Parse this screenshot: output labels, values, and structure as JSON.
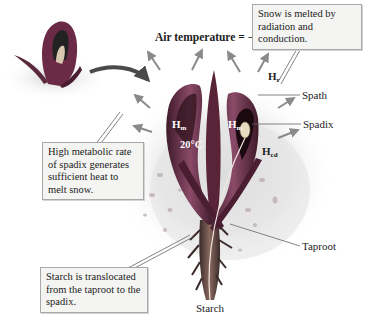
{
  "title": "Air temperature = − 15°C",
  "callouts": {
    "snow_melt": "Snow is melted by radiation and conduction.",
    "metabolic": "High metabolic rate of spadix generates sufficient heat to melt snow.",
    "starch": "Starch is translocated from the taproot to the spadix."
  },
  "labels": {
    "spath": "Spath",
    "spadix": "Spadix",
    "taproot": "Taproot",
    "starch": "Starch",
    "inner_temp": "20°C"
  },
  "heat_symbols": {
    "h_r": {
      "base": "H",
      "sub": "r"
    },
    "h_m_left": {
      "base": "H",
      "sub": "m"
    },
    "h_m_right": {
      "base": "H",
      "sub": "m"
    },
    "h_cd": {
      "base": "H",
      "sub": "cd"
    }
  },
  "colors": {
    "plant": "#6b2a45",
    "plant_light": "#a86585",
    "arrow": "#8a8a8a",
    "curved_arrow": "#4a4a4a",
    "snow": "#e4e4e4",
    "callout_bg": "#f4f4f2"
  }
}
